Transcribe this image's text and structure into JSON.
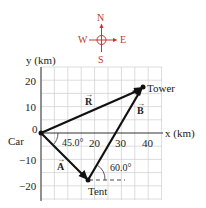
{
  "compass": {
    "north": "N",
    "south": "S",
    "east": "E",
    "west": "W",
    "color": "#c0392b"
  },
  "axes": {
    "y_label": "y (km)",
    "x_label": "x (km)",
    "y_ticks": [
      "20",
      "10",
      "0",
      "−10",
      "−20"
    ],
    "x_ticks": [
      "20",
      "30",
      "40"
    ]
  },
  "points": {
    "car": "Car",
    "tent": "Tent",
    "tower": "Tower"
  },
  "vectors": {
    "A": "A",
    "B": "B",
    "R": "R"
  },
  "angles": {
    "a_angle": "45.0°",
    "b_angle": "60.0°"
  },
  "diagram_data": {
    "car": [
      0,
      0
    ],
    "tent": [
      17.7,
      -17.7
    ],
    "tower": [
      37.7,
      16.9
    ],
    "A": {
      "magnitude_direction": "45.0° below +x",
      "from": "car",
      "to": "tent"
    },
    "B": {
      "magnitude_direction": "60.0° above +x",
      "from": "tent",
      "to": "tower"
    },
    "R": {
      "from": "car",
      "to": "tower"
    }
  }
}
